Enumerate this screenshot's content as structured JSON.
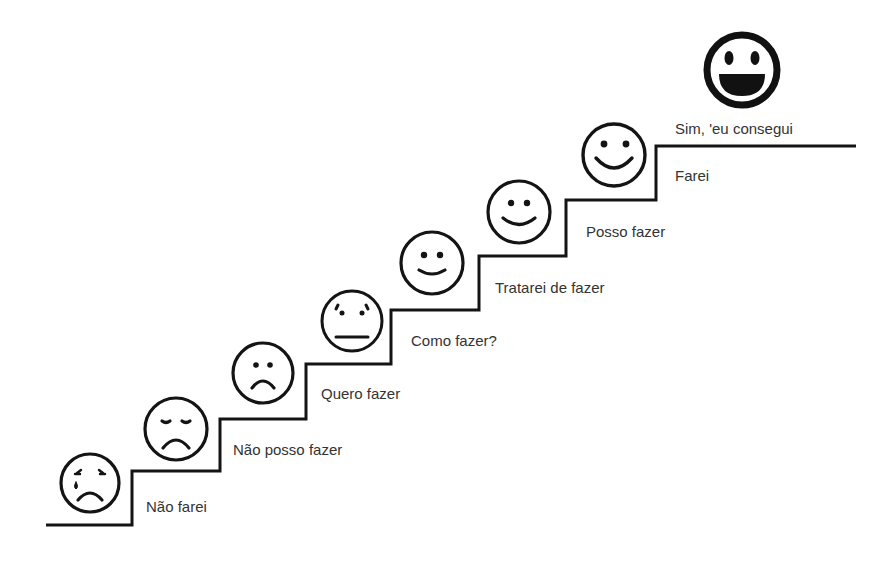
{
  "diagram": {
    "type": "staircase",
    "stroke_color": "#141414",
    "text_color": "#333333",
    "steps": [
      {
        "label": "Não farei",
        "face": "crying-face",
        "label_x": 146,
        "label_y": 499
      },
      {
        "label": "Não posso fazer",
        "face": "sad-closed-eyes-face",
        "label_x": 233,
        "label_y": 442
      },
      {
        "label": "Quero fazer",
        "face": "frowning-face",
        "label_x": 321,
        "label_y": 386
      },
      {
        "label": "Como fazer?",
        "face": "neutral-face",
        "label_x": 411,
        "label_y": 333
      },
      {
        "label": "Tratarei de fazer",
        "face": "slight-smile-face",
        "label_x": 495,
        "label_y": 280
      },
      {
        "label": "Posso fazer",
        "face": "smile-face",
        "label_x": 586,
        "label_y": 224
      },
      {
        "label": "Farei",
        "face": "big-smile-face",
        "label_x": 675,
        "label_y": 168
      },
      {
        "label": "Sim, 'eu consegui",
        "face": "grinning-face",
        "label_x": 675,
        "label_y": 121
      }
    ]
  }
}
